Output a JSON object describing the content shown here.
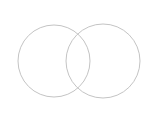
{
  "diagram": {
    "type": "venn",
    "sets": [
      {
        "id": "left",
        "label": "",
        "cx": 54,
        "cy": 61,
        "r": 36
      },
      {
        "id": "right",
        "label": "",
        "cx": 103,
        "cy": 61,
        "r": 37
      }
    ],
    "stroke_color": "#c4c4c4",
    "background": "#ffffff"
  }
}
